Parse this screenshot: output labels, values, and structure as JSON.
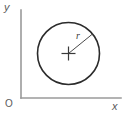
{
  "figure": {
    "background_color": "#ffffff"
  },
  "axes": {
    "origin_label": "O",
    "x_axis_label": "x",
    "y_axis_label": "y",
    "axis_color": "#9a9a9a",
    "label_color": "#5a5a5a",
    "x_axis": {
      "x1": 21,
      "y1": 98,
      "x2": 121,
      "y2": 98
    },
    "y_axis": {
      "x1": 21,
      "y1": 10,
      "x2": 21,
      "y2": 98
    }
  },
  "shapes": {
    "circle": {
      "name": "circle",
      "center_x": 68.5,
      "center_y": 53.5,
      "radius": 31,
      "stroke_color": "#2b2b2b",
      "stroke_width": 1.6,
      "fill": "none"
    },
    "center_mark": {
      "name": "center-cross",
      "x": 68.5,
      "y": 53.5,
      "arm_length": 7,
      "stroke_color": "#3a3a3a",
      "stroke_width": 1.2
    },
    "radius_line": {
      "name": "radius-line",
      "x1": 68.5,
      "y1": 53.5,
      "x2": 92.5,
      "y2": 34.0,
      "stroke_color": "#4a4a4a",
      "stroke_width": 1
    }
  },
  "annotations": {
    "radius_label": "r",
    "radius_label_color": "#3a3a3a"
  }
}
